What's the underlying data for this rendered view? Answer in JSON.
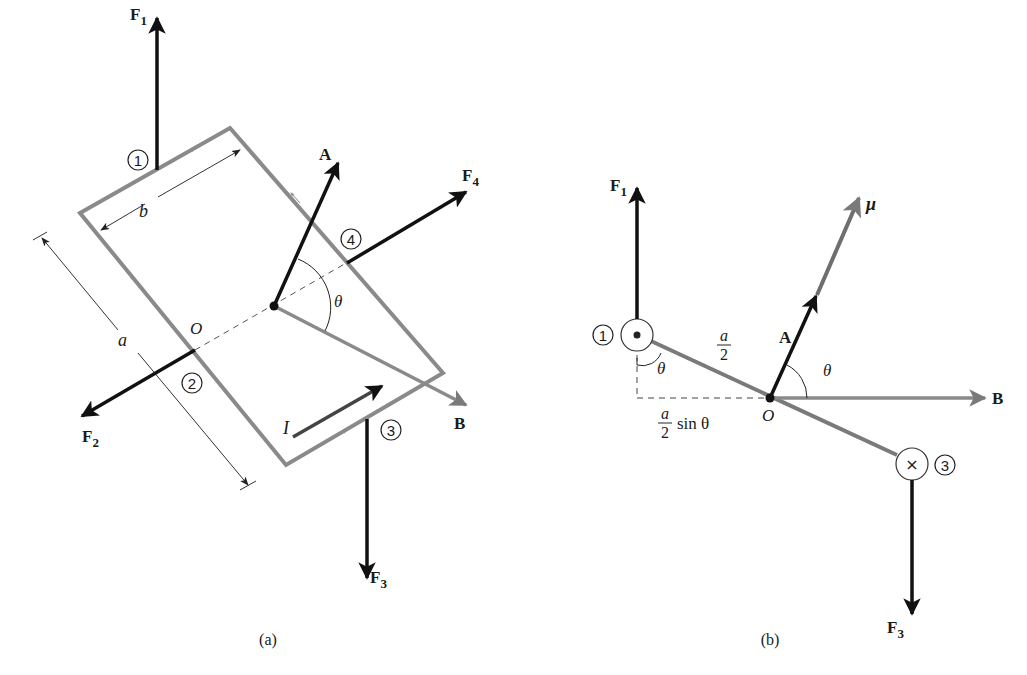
{
  "figure": {
    "panel_a": {
      "caption": "(a)",
      "labels": {
        "F1": "F",
        "F1_sub": "1",
        "F2": "F",
        "F2_sub": "2",
        "F3": "F",
        "F3_sub": "3",
        "F4": "F",
        "F4_sub": "4",
        "A": "A",
        "B": "B",
        "O": "O",
        "theta": "θ",
        "a": "a",
        "b": "b",
        "I": "I",
        "side1": "1",
        "side2": "2",
        "side3": "3",
        "side4": "4"
      }
    },
    "panel_b": {
      "caption": "(b)",
      "labels": {
        "F1": "F",
        "F1_sub": "1",
        "F3": "F",
        "F3_sub": "3",
        "mu": "μ",
        "A": "A",
        "B": "B",
        "O": "O",
        "theta_left": "θ",
        "theta_right": "θ",
        "a_over_2_num": "a",
        "a_over_2_den": "2",
        "asin_num": "a",
        "asin_den": "2",
        "asin_tail": "sin θ",
        "side1": "1",
        "side3": "3",
        "dot_symbol": "•",
        "cross_symbol": "×"
      }
    },
    "colors": {
      "black_vector": "#111111",
      "gray_loop": "#8a8a8a",
      "gray_vector": "#7a7a7a",
      "thin_line": "#333333"
    }
  }
}
